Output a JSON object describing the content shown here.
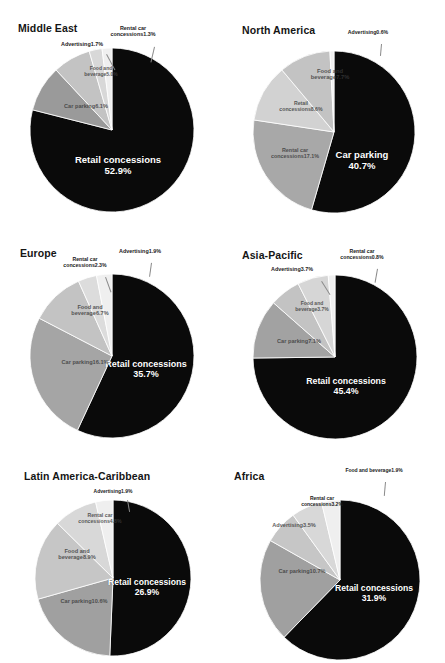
{
  "figure": {
    "background": "#ffffff",
    "palette": {
      "retail_concessions": "#0a0a0a",
      "car_parking": "#9a9a9a",
      "food_and_beverage": "#c3c3c3",
      "rental_car_concessions": "#d8d8d8",
      "advertising": "#efefef",
      "slice_outline": "#ffffff",
      "leader_line": "#8a8a8a",
      "inside_label_text": "#ffffff",
      "outside_label_text": "#1a1a1a"
    }
  },
  "chart_data": [
    {
      "type": "pie",
      "title": "Middle East",
      "categories": [
        "Retail concessions",
        "Car parking",
        "Food and beverage",
        "Advertising",
        "Rental car concessions"
      ],
      "values": [
        52.9,
        6.1,
        5.0,
        1.7,
        1.3
      ],
      "labels": [
        "52.9%",
        "6.1%",
        "5.0%",
        "1.7%",
        "1.3%"
      ],
      "colors": [
        "#0a0a0a",
        "#9a9a9a",
        "#c3c3c3",
        "#d8d8d8",
        "#efefef"
      ],
      "label_placement": [
        "inside",
        "on-slice",
        "on-slice",
        "outside",
        "outside"
      ]
    },
    {
      "type": "pie",
      "title": "North America",
      "categories": [
        "Car parking",
        "Advertising",
        "Food and beverage",
        "Retail concessions",
        "Rental car concessions"
      ],
      "values": [
        40.7,
        0.6,
        7.7,
        8.6,
        17.1
      ],
      "labels": [
        "40.7%",
        "0.6%",
        "7.7%",
        "8.6%",
        "17.1%"
      ],
      "colors": [
        "#0a0a0a",
        "#efefef",
        "#c3c3c3",
        "#d2d2d2",
        "#a8a8a8"
      ],
      "label_placement": [
        "inside",
        "outside",
        "on-slice",
        "on-slice",
        "on-slice"
      ]
    },
    {
      "type": "pie",
      "title": "Europe",
      "categories": [
        "Retail concessions",
        "Advertising",
        "Rental car concessions",
        "Food and beverage",
        "Car parking"
      ],
      "values": [
        35.7,
        1.9,
        2.3,
        6.7,
        16.1
      ],
      "labels": [
        "35.7%",
        "1.9%",
        "2.3%",
        "6.7%",
        "16.1%"
      ],
      "colors": [
        "#0a0a0a",
        "#efefef",
        "#dcdcdc",
        "#c3c3c3",
        "#a5a5a5"
      ],
      "label_placement": [
        "inside",
        "outside",
        "outside",
        "on-slice",
        "on-slice"
      ]
    },
    {
      "type": "pie",
      "title": "Asia-Pacific",
      "categories": [
        "Retail concessions",
        "Rental car concessions",
        "Advertising",
        "Food and beverage",
        "Car parking"
      ],
      "values": [
        45.4,
        0.8,
        3.7,
        3.7,
        7.1
      ],
      "labels": [
        "45.4%",
        "0.8%",
        "3.7%",
        "3.7%",
        "7.1%"
      ],
      "colors": [
        "#0a0a0a",
        "#efefef",
        "#d6d6d6",
        "#c3c3c3",
        "#a2a2a2"
      ],
      "label_placement": [
        "inside",
        "outside",
        "outside",
        "on-slice",
        "on-slice"
      ]
    },
    {
      "type": "pie",
      "title": "Latin America-Caribbean",
      "categories": [
        "Retail concessions",
        "Advertising",
        "Rental car concessions",
        "Food and beverage",
        "Car parking"
      ],
      "values": [
        26.9,
        1.9,
        4.8,
        8.9,
        10.6
      ],
      "labels": [
        "26.9%",
        "1.9%",
        "4.8%",
        "8.9%",
        "10.6%"
      ],
      "colors": [
        "#0a0a0a",
        "#efefef",
        "#d8d8d8",
        "#c6c6c6",
        "#a0a0a0"
      ],
      "label_placement": [
        "inside",
        "outside",
        "on-slice",
        "on-slice",
        "on-slice"
      ]
    },
    {
      "type": "pie",
      "title": "Africa",
      "categories": [
        "Retail concessions",
        "Food and beverage",
        "Rental car concessions",
        "Advertising",
        "Car parking"
      ],
      "values": [
        31.9,
        1.9,
        3.2,
        3.5,
        10.7
      ],
      "labels": [
        "31.9%",
        "1.9%",
        "3.2%",
        "3.5%",
        "10.7%"
      ],
      "colors": [
        "#0a0a0a",
        "#efefef",
        "#d8d8d8",
        "#c6c6c6",
        "#a0a0a0"
      ],
      "label_placement": [
        "inside",
        "outside",
        "outside",
        "on-slice",
        "on-slice"
      ]
    }
  ],
  "charts": [
    {
      "id": "middle-east",
      "title": "Middle East",
      "title_pos": {
        "x": 18,
        "y": 22
      },
      "pie": {
        "cx": 112,
        "cy": 130,
        "r": 82,
        "start_angle": 0
      },
      "slices": [
        {
          "name": "retail-concessions",
          "label": "Retail concessions",
          "pct": "52.9%",
          "value": 52.9,
          "color": "#0a0a0a"
        },
        {
          "name": "car-parking",
          "label": "Car parking",
          "pct": "6.1%",
          "value": 6.1,
          "color": "#9a9a9a"
        },
        {
          "name": "food-and-beverage",
          "label": "Food and beverage",
          "pct": "5.0%",
          "value": 5.0,
          "color": "#c3c3c3"
        },
        {
          "name": "advertising",
          "label": "Advertising",
          "pct": "1.7%",
          "value": 1.7,
          "color": "#d8d8d8"
        },
        {
          "name": "rental-car-concessions",
          "label": "Rental car concessions",
          "pct": "1.3%",
          "value": 1.3,
          "color": "#efefef"
        }
      ],
      "labels": [
        {
          "name": "retail-concessions",
          "kind": "in",
          "text": "Retail concessions",
          "pct": "52.9%",
          "x": 118,
          "y": 155,
          "size": 9.5,
          "w": 120
        },
        {
          "name": "car-parking",
          "kind": "on",
          "text": "Car parking",
          "pct": "6.1%",
          "x": 86,
          "y": 103,
          "size": 5.6,
          "w": 62
        },
        {
          "name": "food-and-beverage",
          "kind": "on",
          "text": "Food and beverage",
          "pct": "5.0%",
          "x": 101,
          "y": 66,
          "size": 5.0,
          "w": 44
        },
        {
          "name": "advertising",
          "kind": "out",
          "text": "Advertising",
          "pct": "1.7%",
          "x": 82,
          "y": 41,
          "size": 5.4,
          "w": 54,
          "leader": {
            "x": 107,
            "y": 54,
            "len": 18,
            "rot": 62
          }
        },
        {
          "name": "rental-car-concessions",
          "kind": "out",
          "text": "Rental car concessions",
          "pct": "1.3%",
          "x": 133,
          "y": 25,
          "size": 5.4,
          "w": 52,
          "leader": {
            "x": 155,
            "y": 47,
            "len": 16,
            "rot": 103
          }
        }
      ]
    },
    {
      "id": "north-america",
      "title": "North America",
      "title_pos": {
        "x": 20,
        "y": 24
      },
      "pie": {
        "cx": 112,
        "cy": 132,
        "r": 81,
        "start_angle": 0
      },
      "slices": [
        {
          "name": "car-parking",
          "label": "Car parking",
          "pct": "40.7%",
          "value": 40.7,
          "color": "#0a0a0a"
        },
        {
          "name": "rental-car-concessions",
          "label": "Rental car concessions",
          "pct": "17.1%",
          "value": 17.1,
          "color": "#a8a8a8"
        },
        {
          "name": "retail-concessions",
          "label": "Retail concessions",
          "pct": "8.6%",
          "value": 8.6,
          "color": "#d2d2d2"
        },
        {
          "name": "food-and-beverage",
          "label": "Food and beverage",
          "pct": "7.7%",
          "value": 7.7,
          "color": "#c3c3c3"
        },
        {
          "name": "advertising",
          "label": "Advertising",
          "pct": "0.6%",
          "value": 0.6,
          "color": "#efefef"
        }
      ],
      "labels": [
        {
          "name": "car-parking",
          "kind": "in",
          "text": "Car parking",
          "pct": "40.7%",
          "x": 140,
          "y": 150,
          "size": 9.5,
          "w": 96
        },
        {
          "name": "rental-car-concessions",
          "kind": "on",
          "text": "Rental car concessions",
          "pct": "17.1%",
          "x": 73,
          "y": 148,
          "size": 5.4,
          "w": 50
        },
        {
          "name": "retail-concessions",
          "kind": "on",
          "text": "Retail concessions",
          "pct": "8.6%",
          "x": 79,
          "y": 101,
          "size": 5.2,
          "w": 46
        },
        {
          "name": "food-and-beverage",
          "kind": "on",
          "text": "Food and beverage",
          "pct": "7.7%",
          "x": 108,
          "y": 68,
          "size": 5.8,
          "w": 44
        },
        {
          "name": "advertising",
          "kind": "out",
          "text": "Advertising",
          "pct": "0.6%",
          "x": 146,
          "y": 30,
          "size": 5.2,
          "w": 48,
          "leader": {
            "x": 160,
            "y": 44,
            "len": 12,
            "rot": 95
          }
        }
      ]
    },
    {
      "id": "europe",
      "title": "Europe",
      "title_pos": {
        "x": 20,
        "y": 22
      },
      "pie": {
        "cx": 112,
        "cy": 131,
        "r": 82,
        "start_angle": 0
      },
      "slices": [
        {
          "name": "retail-concessions",
          "label": "Retail concessions",
          "pct": "35.7%",
          "value": 35.7,
          "color": "#0a0a0a"
        },
        {
          "name": "car-parking",
          "label": "Car parking",
          "pct": "16.1%",
          "value": 16.1,
          "color": "#a5a5a5"
        },
        {
          "name": "food-and-beverage",
          "label": "Food and beverage",
          "pct": "6.7%",
          "value": 6.7,
          "color": "#c3c3c3"
        },
        {
          "name": "rental-car-concessions",
          "label": "Rental car concessions",
          "pct": "2.3%",
          "value": 2.3,
          "color": "#dcdcdc"
        },
        {
          "name": "advertising",
          "label": "Advertising",
          "pct": "1.9%",
          "value": 1.9,
          "color": "#efefef"
        }
      ],
      "labels": [
        {
          "name": "retail-concessions",
          "kind": "in",
          "text": "Retail concessions",
          "pct": "35.7%",
          "x": 146,
          "y": 134,
          "size": 9.0,
          "w": 84
        },
        {
          "name": "car-parking",
          "kind": "on",
          "text": "Car parking",
          "pct": "16.1%",
          "x": 85,
          "y": 134,
          "size": 5.6,
          "w": 58
        },
        {
          "name": "food-and-beverage",
          "kind": "on",
          "text": "Food and beverage",
          "pct": "6.7%",
          "x": 90,
          "y": 79,
          "size": 5.6,
          "w": 48
        },
        {
          "name": "rental-car-concessions",
          "kind": "out",
          "text": "Rental car concessions",
          "pct": "2.3%",
          "x": 85,
          "y": 32,
          "size": 5.2,
          "w": 52,
          "leader": {
            "x": 106,
            "y": 52,
            "len": 16,
            "rot": 70
          }
        },
        {
          "name": "advertising",
          "kind": "out",
          "text": "Advertising",
          "pct": "1.9%",
          "x": 140,
          "y": 23,
          "size": 5.4,
          "w": 52,
          "leader": {
            "x": 152,
            "y": 38,
            "len": 14,
            "rot": 98
          }
        }
      ]
    },
    {
      "id": "asia-pacific",
      "title": "Asia-Pacific",
      "title_pos": {
        "x": 20,
        "y": 24
      },
      "pie": {
        "cx": 113,
        "cy": 132,
        "r": 82,
        "start_angle": 0
      },
      "slices": [
        {
          "name": "retail-concessions",
          "label": "Retail concessions",
          "pct": "45.4%",
          "value": 45.4,
          "color": "#0a0a0a"
        },
        {
          "name": "car-parking",
          "label": "Car parking",
          "pct": "7.1%",
          "value": 7.1,
          "color": "#a2a2a2"
        },
        {
          "name": "food-and-beverage",
          "label": "Food and beverage",
          "pct": "3.7%",
          "value": 3.7,
          "color": "#c3c3c3"
        },
        {
          "name": "advertising",
          "label": "Advertising",
          "pct": "3.7%",
          "value": 3.7,
          "color": "#d6d6d6"
        },
        {
          "name": "rental-car-concessions",
          "label": "Rental car concessions",
          "pct": "0.8%",
          "value": 0.8,
          "color": "#efefef"
        }
      ],
      "labels": [
        {
          "name": "retail-concessions",
          "kind": "in",
          "text": "Retail concessions",
          "pct": "45.4%",
          "x": 124,
          "y": 152,
          "size": 8.8,
          "w": 112
        },
        {
          "name": "car-parking",
          "kind": "on",
          "text": "Car parking",
          "pct": "7.1%",
          "x": 77,
          "y": 113,
          "size": 5.6,
          "w": 58
        },
        {
          "name": "food-and-beverage",
          "kind": "on",
          "text": "Food and beverage",
          "pct": "3.7%",
          "x": 90,
          "y": 76,
          "size": 5.0,
          "w": 42
        },
        {
          "name": "advertising",
          "kind": "out",
          "text": "Advertising",
          "pct": "3.7%",
          "x": 70,
          "y": 41,
          "size": 5.4,
          "w": 54,
          "leader": {
            "x": 100,
            "y": 56,
            "len": 16,
            "rot": 58
          }
        },
        {
          "name": "rental-car-concessions",
          "kind": "out",
          "text": "Rental car concessions",
          "pct": "0.8%",
          "x": 140,
          "y": 24,
          "size": 5.2,
          "w": 54,
          "leader": {
            "x": 156,
            "y": 44,
            "len": 14,
            "rot": 100
          }
        }
      ]
    },
    {
      "id": "latin-america-caribbean",
      "title": "Latin America-Caribbean",
      "title_pos": {
        "x": 24,
        "y": 20
      },
      "pie": {
        "cx": 113,
        "cy": 128,
        "r": 78,
        "start_angle": 0
      },
      "slices": [
        {
          "name": "retail-concessions",
          "label": "Retail concessions",
          "pct": "26.9%",
          "value": 26.9,
          "color": "#0a0a0a"
        },
        {
          "name": "car-parking",
          "label": "Car parking",
          "pct": "10.6%",
          "value": 10.6,
          "color": "#a0a0a0"
        },
        {
          "name": "food-and-beverage",
          "label": "Food and beverage",
          "pct": "8.9%",
          "value": 8.9,
          "color": "#c6c6c6"
        },
        {
          "name": "rental-car-concessions",
          "label": "Rental car concessions",
          "pct": "4.8%",
          "value": 4.8,
          "color": "#d8d8d8"
        },
        {
          "name": "advertising",
          "label": "Advertising",
          "pct": "1.9%",
          "value": 1.9,
          "color": "#efefef"
        }
      ],
      "labels": [
        {
          "name": "retail-concessions",
          "kind": "in",
          "text": "Retail concessions",
          "pct": "26.9%",
          "x": 147,
          "y": 128,
          "size": 8.6,
          "w": 80
        },
        {
          "name": "car-parking",
          "kind": "on",
          "text": "Car parking",
          "pct": "10.6%",
          "x": 84,
          "y": 148,
          "size": 5.6,
          "w": 58
        },
        {
          "name": "food-and-beverage",
          "kind": "on",
          "text": "Food and beverage",
          "pct": "8.9%",
          "x": 77,
          "y": 98,
          "size": 5.6,
          "w": 44
        },
        {
          "name": "rental-car-concessions",
          "kind": "on",
          "text": "Rental car concessions",
          "pct": "4.8%",
          "x": 100,
          "y": 63,
          "size": 5.2,
          "w": 48
        },
        {
          "name": "advertising",
          "kind": "out",
          "text": "Advertising",
          "pct": "1.9%",
          "x": 113,
          "y": 39,
          "size": 5.0,
          "w": 46,
          "leader": {
            "x": 128,
            "y": 50,
            "len": 12,
            "rot": 80
          }
        }
      ]
    },
    {
      "id": "africa",
      "title": "Africa",
      "title_pos": {
        "x": 12,
        "y": 20
      },
      "pie": {
        "cx": 118,
        "cy": 130,
        "r": 80,
        "start_angle": 0
      },
      "slices": [
        {
          "name": "retail-concessions",
          "label": "Retail concessions",
          "pct": "31.9%",
          "value": 31.9,
          "color": "#0a0a0a"
        },
        {
          "name": "car-parking",
          "label": "Car parking",
          "pct": "10.7%",
          "value": 10.7,
          "color": "#a0a0a0"
        },
        {
          "name": "advertising",
          "label": "Advertising",
          "pct": "3.5%",
          "value": 3.5,
          "color": "#c6c6c6"
        },
        {
          "name": "rental-car-concessions",
          "label": "Rental car concessions",
          "pct": "3.2%",
          "value": 3.2,
          "color": "#d8d8d8"
        },
        {
          "name": "food-and-beverage",
          "label": "Food and beverage",
          "pct": "1.9%",
          "value": 1.9,
          "color": "#efefef"
        }
      ],
      "labels": [
        {
          "name": "retail-concessions",
          "kind": "in",
          "text": "Retail concessions",
          "pct": "31.9%",
          "x": 152,
          "y": 134,
          "size": 8.6,
          "w": 82
        },
        {
          "name": "car-parking",
          "kind": "on",
          "text": "Car parking",
          "pct": "10.7%",
          "x": 80,
          "y": 118,
          "size": 5.6,
          "w": 58
        },
        {
          "name": "advertising",
          "kind": "on",
          "text": "Advertising",
          "pct": "3.5%",
          "x": 72,
          "y": 72,
          "size": 5.6,
          "w": 50
        },
        {
          "name": "rental-car-concessions",
          "kind": "out",
          "text": "Rental car concessions",
          "pct": "3.2%",
          "x": 100,
          "y": 46,
          "size": 5.0,
          "w": 48
        },
        {
          "name": "food-and-beverage",
          "kind": "out",
          "text": "Food and beverage",
          "pct": "1.9%",
          "x": 152,
          "y": 18,
          "size": 5.0,
          "w": 64,
          "leader": {
            "x": 164,
            "y": 32,
            "len": 14,
            "rot": 95
          }
        }
      ]
    }
  ]
}
